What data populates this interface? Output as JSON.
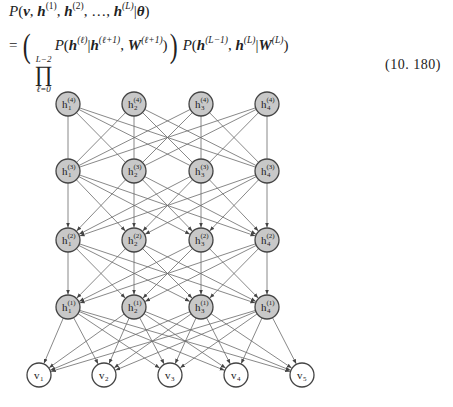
{
  "equation": {
    "line1": {
      "P": "P",
      "v": "v",
      "h": "h",
      "sup1": "(1)",
      "sup2": "(2)",
      "dots": "…",
      "supL": "(L)",
      "theta": "θ"
    },
    "line2": {
      "equals": "=",
      "prod_upper": "L−2",
      "prod_lower": "ℓ=0",
      "prod_symbol": "∏",
      "sup_l": "(ℓ)",
      "sup_l1": "(ℓ+1)",
      "W": "W",
      "sup_Lm1": "(L−1)",
      "sup_L": "(L)"
    },
    "number": "(10. 180)"
  },
  "diagram": {
    "hidden_fill": "#c8c8c8",
    "visible_fill": "#ffffff",
    "stroke": "#444444",
    "edge_color": "#6a6a6a",
    "layers": [
      {
        "name": "layer-4",
        "y": 104,
        "nodes": [
          {
            "id": "h1_4",
            "base": "h",
            "sub": "1",
            "sup": "(4)",
            "x": 68
          },
          {
            "id": "h2_4",
            "base": "h",
            "sub": "2",
            "sup": "(4)",
            "x": 134
          },
          {
            "id": "h3_4",
            "base": "h",
            "sub": "3",
            "sup": "(4)",
            "x": 201
          },
          {
            "id": "h4_4",
            "base": "h",
            "sub": "4",
            "sup": "(4)",
            "x": 267
          }
        ]
      },
      {
        "name": "layer-3",
        "y": 171,
        "nodes": [
          {
            "id": "h1_3",
            "base": "h",
            "sub": "1",
            "sup": "(3)",
            "x": 68
          },
          {
            "id": "h2_3",
            "base": "h",
            "sub": "2",
            "sup": "(3)",
            "x": 134
          },
          {
            "id": "h3_3",
            "base": "h",
            "sub": "3",
            "sup": "(3)",
            "x": 201
          },
          {
            "id": "h4_3",
            "base": "h",
            "sub": "4",
            "sup": "(3)",
            "x": 267
          }
        ]
      },
      {
        "name": "layer-2",
        "y": 240,
        "nodes": [
          {
            "id": "h1_2",
            "base": "h",
            "sub": "1",
            "sup": "(2)",
            "x": 68
          },
          {
            "id": "h2_2",
            "base": "h",
            "sub": "2",
            "sup": "(2)",
            "x": 134
          },
          {
            "id": "h3_2",
            "base": "h",
            "sub": "3",
            "sup": "(2)",
            "x": 201
          },
          {
            "id": "h4_2",
            "base": "h",
            "sub": "4",
            "sup": "(2)",
            "x": 267
          }
        ]
      },
      {
        "name": "layer-1",
        "y": 307,
        "nodes": [
          {
            "id": "h1_1",
            "base": "h",
            "sub": "1",
            "sup": "(1)",
            "x": 68
          },
          {
            "id": "h2_1",
            "base": "h",
            "sub": "2",
            "sup": "(1)",
            "x": 134
          },
          {
            "id": "h3_1",
            "base": "h",
            "sub": "3",
            "sup": "(1)",
            "x": 201
          },
          {
            "id": "h4_1",
            "base": "h",
            "sub": "4",
            "sup": "(1)",
            "x": 267
          }
        ]
      },
      {
        "name": "visible",
        "y": 375,
        "visible": true,
        "nodes": [
          {
            "id": "v1",
            "base": "v",
            "sub": "1",
            "sup": "",
            "x": 39
          },
          {
            "id": "v2",
            "base": "v",
            "sub": "2",
            "sup": "",
            "x": 104
          },
          {
            "id": "v3",
            "base": "v",
            "sub": "3",
            "sup": "",
            "x": 170
          },
          {
            "id": "v4",
            "base": "v",
            "sub": "4",
            "sup": "",
            "x": 236
          },
          {
            "id": "v5",
            "base": "v",
            "sub": "5",
            "sup": "",
            "x": 302
          }
        ]
      }
    ],
    "connections": [
      {
        "from": 0,
        "to": 1,
        "directed": false
      },
      {
        "from": 1,
        "to": 2,
        "directed": true
      },
      {
        "from": 2,
        "to": 3,
        "directed": true
      },
      {
        "from": 3,
        "to": 4,
        "directed": true
      }
    ],
    "radius": 12
  }
}
